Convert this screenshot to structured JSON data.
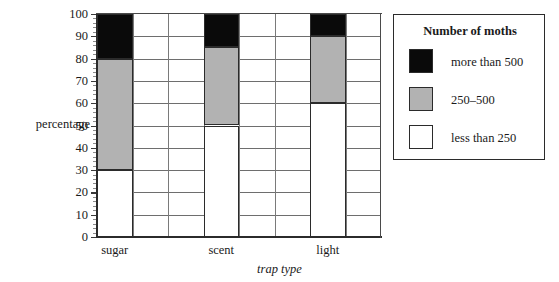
{
  "chart_data": {
    "type": "bar",
    "stacked": true,
    "title": "",
    "xlabel": "trap type",
    "ylabel": "percentage",
    "categories": [
      "sugar",
      "scent",
      "light"
    ],
    "series": [
      {
        "name": "less than 250",
        "color": "#ffffff",
        "values": [
          30,
          50,
          60
        ]
      },
      {
        "name": "250–500",
        "color": "#b2b2b2",
        "values": [
          50,
          35,
          30
        ]
      },
      {
        "name": "more than 500",
        "color": "#0a0a0a",
        "values": [
          20,
          15,
          10
        ]
      }
    ],
    "stack_boundaries": {
      "sugar": [
        0,
        30,
        80,
        100
      ],
      "scent": [
        0,
        50,
        85,
        100
      ],
      "light": [
        0,
        60,
        90,
        100
      ]
    },
    "ylim": [
      0,
      100
    ],
    "ytick_step": 10,
    "yticks": [
      0,
      10,
      20,
      30,
      40,
      50,
      60,
      70,
      80,
      90,
      100
    ],
    "ytick_labels": [
      "0",
      "10",
      "20",
      "30",
      "40",
      "50",
      "60",
      "70",
      "80",
      "90",
      "100"
    ],
    "minor_ticks_per_major": 5,
    "grid": "both",
    "legend_position": "right"
  },
  "legend": {
    "title": "Number of moths",
    "entries": [
      {
        "swatch": "black",
        "label": "more than 500"
      },
      {
        "swatch": "gray",
        "label": "250–500"
      },
      {
        "swatch": "white",
        "label": "less than 250"
      }
    ]
  }
}
